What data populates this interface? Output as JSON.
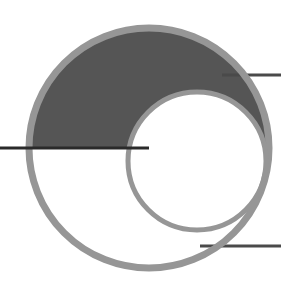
{
  "canvas": {
    "width": 281,
    "height": 290,
    "background_color": "#ffffff",
    "title": "Two overlapping circles with shaded lune and three horizontal secant lines"
  },
  "palette": {
    "stroke_gray": "#969696",
    "fill_dark_gray": "#555555",
    "line_dark": "#2a2a2a",
    "background": "#ffffff"
  },
  "chart_data": {
    "type": "diagram",
    "title": "Two overlapping circles with shaded region",
    "shapes": [
      {
        "name": "large-circle",
        "type": "circle",
        "cx": 149,
        "cy": 148,
        "r": 120,
        "stroke": "#969696",
        "stroke_width": 7,
        "fill": "none"
      },
      {
        "name": "small-circle",
        "type": "circle",
        "cx": 197,
        "cy": 161,
        "r": 69,
        "stroke": "#969696",
        "stroke_width": 5,
        "fill": "none"
      },
      {
        "name": "shaded-lune",
        "type": "region",
        "description": "Upper-left crescent: inside large circle, above the horizontal chord at y=148, and outside the small circle",
        "fill": "#555555"
      }
    ],
    "lines": [
      {
        "name": "left-secant-line",
        "x1": 0,
        "y1": 148,
        "x2": 149,
        "y2": 148,
        "stroke": "#2a2a2a",
        "stroke_width": 3
      },
      {
        "name": "upper-right-secant-line",
        "x1": 228,
        "y1": 75,
        "x2": 281,
        "y2": 75,
        "stroke": "#4a4a4a",
        "stroke_width": 3
      },
      {
        "name": "lower-right-secant-line",
        "x1": 205,
        "y1": 246,
        "x2": 281,
        "y2": 246,
        "stroke": "#4a4a4a",
        "stroke_width": 3
      }
    ],
    "xlim": [
      0,
      281
    ],
    "ylim": [
      0,
      290
    ],
    "grid": false,
    "legend": null
  }
}
